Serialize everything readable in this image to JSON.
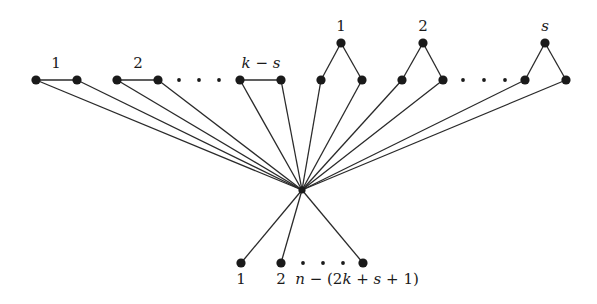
{
  "diagram": {
    "hub": {
      "x": 302,
      "y": 190
    },
    "edge_groups": [
      {
        "label": "1",
        "italic": false,
        "type": "edge",
        "nodes": [
          [
            36,
            80
          ],
          [
            77,
            80
          ]
        ],
        "label_pos": [
          56,
          68
        ]
      },
      {
        "label": "2",
        "italic": false,
        "type": "edge",
        "nodes": [
          [
            117,
            80
          ],
          [
            158,
            80
          ]
        ],
        "label_pos": [
          138,
          68
        ]
      },
      {
        "label": "k − s",
        "italic": true,
        "type": "edge",
        "nodes": [
          [
            240,
            80
          ],
          [
            281,
            80
          ]
        ],
        "label_pos": [
          261,
          68
        ]
      }
    ],
    "edge_ellipsis": [
      [
        179,
        80
      ],
      [
        199,
        80
      ],
      [
        219,
        80
      ]
    ],
    "cherries": [
      {
        "label": "1",
        "italic": false,
        "top": [
          341,
          43
        ],
        "bottom": [
          [
            321,
            80
          ],
          [
            362,
            80
          ]
        ],
        "label_pos": [
          341,
          31
        ]
      },
      {
        "label": "2",
        "italic": false,
        "top": [
          423,
          43
        ],
        "bottom": [
          [
            402,
            80
          ],
          [
            443,
            80
          ]
        ],
        "label_pos": [
          423,
          31
        ]
      },
      {
        "label": "s",
        "italic": true,
        "top": [
          545,
          43
        ],
        "bottom": [
          [
            525,
            80
          ],
          [
            566,
            80
          ]
        ],
        "label_pos": [
          545,
          31
        ]
      }
    ],
    "cherry_ellipsis": [
      [
        463,
        80
      ],
      [
        484,
        80
      ],
      [
        505,
        80
      ]
    ],
    "pendants": [
      {
        "label": "1",
        "node": [
          241,
          263
        ],
        "label_pos": [
          241,
          284
        ]
      },
      {
        "label": "2",
        "node": [
          281,
          263
        ],
        "label_pos": [
          281,
          284
        ]
      },
      {
        "label": "",
        "node": [
          363,
          263
        ],
        "label_pos": [
          363,
          284
        ]
      }
    ],
    "pendant_ellipsis": [
      [
        303,
        263
      ],
      [
        323,
        263
      ],
      [
        343,
        263
      ]
    ],
    "pendant_last_label": {
      "text": "n − (2k + s + 1)",
      "pos": [
        357,
        284
      ]
    },
    "colors": {
      "ink": "#1a1a1a",
      "background": "#ffffff"
    }
  }
}
